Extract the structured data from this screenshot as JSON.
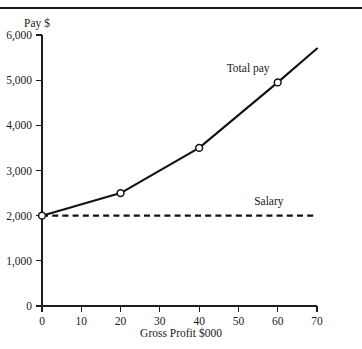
{
  "figure": {
    "top_rule": "horizontal-rule"
  },
  "chart_data": {
    "type": "line",
    "title": "",
    "subtitle": "",
    "xlabel": "Gross Profit $000",
    "ylabel": "Pay $",
    "xlim": [
      0,
      70
    ],
    "ylim": [
      0,
      6000
    ],
    "xticks": [
      0,
      10,
      20,
      30,
      40,
      50,
      60,
      70
    ],
    "xtick_labels": [
      "0",
      "10",
      "20",
      "30",
      "40",
      "50",
      "60",
      "70"
    ],
    "yticks": [
      0,
      1000,
      2000,
      3000,
      4000,
      5000,
      6000
    ],
    "ytick_labels": [
      "0",
      "1,000",
      "2,000",
      "3,000",
      "4,000",
      "5,000",
      "6,000"
    ],
    "grid": false,
    "legend_position": "inline-annotation",
    "series": [
      {
        "name": "Total pay",
        "style": "solid",
        "color": "#111111",
        "markers": "circle",
        "x": [
          0,
          20,
          40,
          60,
          70
        ],
        "values": [
          2000,
          2500,
          3500,
          4950,
          5700
        ],
        "marker_x": [
          0,
          20,
          40,
          60
        ],
        "marker_values": [
          2000,
          2500,
          3500,
          4950
        ],
        "label": "Total pay",
        "label_x": 47,
        "label_y": 5250
      },
      {
        "name": "Salary",
        "style": "dashed",
        "color": "#111111",
        "markers": "none",
        "x": [
          0,
          70
        ],
        "values": [
          2000,
          2000
        ],
        "label": "Salary",
        "label_x": 54,
        "label_y": 2300
      }
    ],
    "annotations": [
      {
        "text": "Total pay",
        "x": 47,
        "y": 5250
      },
      {
        "text": "Salary",
        "x": 54,
        "y": 2300
      }
    ]
  }
}
